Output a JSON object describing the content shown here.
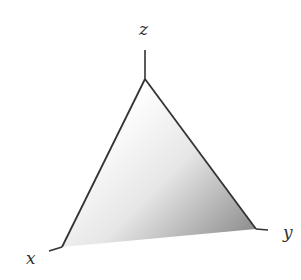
{
  "diagram": {
    "labels": {
      "x": "x",
      "y": "y",
      "z": "z"
    },
    "colors": {
      "line": "#333333",
      "shade_light": "#ffffff",
      "shade_dark": "#8e8e8e"
    },
    "points": {
      "apex_z": [
        145,
        79
      ],
      "corner_x": [
        62,
        247
      ],
      "corner_y": [
        256,
        229
      ],
      "z_axis_top": [
        145,
        50
      ],
      "x_axis_tail": [
        49,
        251
      ],
      "y_axis_tail": [
        268,
        230
      ]
    }
  }
}
